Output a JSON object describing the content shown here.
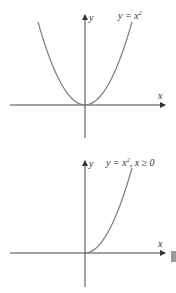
{
  "graphs": [
    {
      "id": "top",
      "equation_label": "y = x",
      "exponent": "2",
      "condition": "",
      "x_axis_label": "x",
      "y_axis_label": "y",
      "curve": "parabola, full"
    },
    {
      "id": "bottom",
      "equation_label": "y = x",
      "exponent": "2",
      "condition": ", x ≥ 0",
      "x_axis_label": "x",
      "y_axis_label": "y",
      "curve": "parabola, right half only"
    }
  ],
  "colors": {
    "axis": "#444444",
    "curve": "#8a7a80",
    "marker": "#9a9a9a"
  }
}
